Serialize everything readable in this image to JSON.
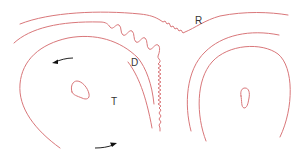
{
  "diagram": {
    "labels": {
      "ridge": "R",
      "divergence": "D",
      "trough": "T"
    },
    "colors": {
      "contour": "#d9777a",
      "arrow": "#111111",
      "text": "#333333",
      "background": "#ffffff"
    },
    "elements": [
      {
        "type": "contour",
        "name": "outer-upper-contour"
      },
      {
        "type": "contour",
        "name": "second-upper-contour-with-wave"
      },
      {
        "type": "contour",
        "name": "left-cyclone-outer-loop"
      },
      {
        "type": "contour",
        "name": "left-closed-center"
      },
      {
        "type": "contour",
        "name": "right-outer-arch"
      },
      {
        "type": "contour",
        "name": "right-inner-arch"
      },
      {
        "type": "contour",
        "name": "right-closed-center"
      },
      {
        "type": "arrow",
        "name": "flow-arrow-upper-left",
        "direction": "left"
      },
      {
        "type": "arrow",
        "name": "flow-arrow-lower",
        "direction": "right"
      }
    ]
  }
}
